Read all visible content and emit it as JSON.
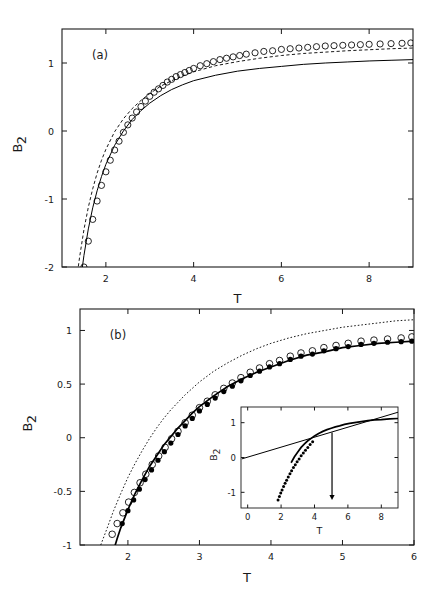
{
  "figure": {
    "background": "#ffffff",
    "foreground": "#000000",
    "width": 436,
    "height": 614
  },
  "chart_data": [
    {
      "id": "panel-a",
      "type": "line",
      "title": "",
      "panel_label": "(a)",
      "xlabel": "T",
      "ylabel": "B2",
      "ylabel_display": "B",
      "ylabel_sub": "2",
      "xlim": [
        1.0,
        9.0
      ],
      "ylim": [
        -2.0,
        1.5
      ],
      "xticks": [
        2,
        4,
        6,
        8
      ],
      "xticklabels": [
        "2",
        "4",
        "6",
        "8"
      ],
      "yticks": [
        1,
        0,
        -1,
        -2
      ],
      "yticklabels": [
        "1",
        "0",
        "-1",
        "-2"
      ],
      "grid": false,
      "legend": "none",
      "plot_box_px": {
        "x": 62,
        "y": 29,
        "w": 351,
        "h": 238
      },
      "series": [
        {
          "name": "solid-curve",
          "style": "solid",
          "x": [
            1.4,
            1.45,
            1.5,
            1.6,
            1.7,
            1.8,
            1.9,
            2.0,
            2.2,
            2.4,
            2.6,
            2.8,
            3.0,
            3.25,
            3.5,
            3.75,
            4.0,
            4.5,
            5.0,
            5.5,
            6.0,
            6.5,
            7.0,
            7.5,
            8.0,
            8.5,
            9.0
          ],
          "y": [
            -2.35,
            -2.07,
            -1.83,
            -1.44,
            -1.13,
            -0.88,
            -0.67,
            -0.49,
            -0.21,
            0.0,
            0.17,
            0.3,
            0.41,
            0.52,
            0.61,
            0.68,
            0.74,
            0.82,
            0.88,
            0.92,
            0.95,
            0.98,
            1.0,
            1.015,
            1.03,
            1.04,
            1.05
          ]
        },
        {
          "name": "dashed-curve",
          "style": "dashed",
          "x": [
            1.3,
            1.35,
            1.4,
            1.5,
            1.6,
            1.7,
            1.8,
            1.9,
            2.0,
            2.2,
            2.4,
            2.6,
            2.8,
            3.0,
            3.25,
            3.5,
            3.75,
            4.0,
            4.5,
            5.0,
            5.5,
            6.0,
            6.5,
            7.0,
            7.5,
            8.0,
            8.5,
            9.0
          ],
          "y": [
            -2.4,
            -2.1,
            -1.86,
            -1.45,
            -1.12,
            -0.85,
            -0.62,
            -0.43,
            -0.27,
            -0.01,
            0.18,
            0.33,
            0.45,
            0.55,
            0.66,
            0.74,
            0.81,
            0.87,
            0.96,
            1.02,
            1.07,
            1.11,
            1.14,
            1.16,
            1.18,
            1.195,
            1.21,
            1.22
          ]
        },
        {
          "name": "open-circle-markers",
          "style": "open-circles",
          "marker_radius_px": 3.1,
          "x": [
            1.5,
            1.6,
            1.7,
            1.8,
            1.9,
            2.0,
            2.1,
            2.2,
            2.3,
            2.4,
            2.5,
            2.6,
            2.7,
            2.8,
            2.9,
            3.0,
            3.1,
            3.2,
            3.3,
            3.4,
            3.5,
            3.6,
            3.7,
            3.8,
            3.9,
            4.0,
            4.15,
            4.3,
            4.45,
            4.6,
            4.75,
            4.9,
            5.05,
            5.2,
            5.4,
            5.6,
            5.8,
            6.0,
            6.2,
            6.4,
            6.6,
            6.8,
            7.0,
            7.2,
            7.4,
            7.6,
            7.8,
            8.0,
            8.25,
            8.5,
            8.75,
            8.95
          ],
          "y": [
            -2.0,
            -1.62,
            -1.3,
            -1.03,
            -0.8,
            -0.6,
            -0.43,
            -0.28,
            -0.15,
            -0.02,
            0.09,
            0.19,
            0.28,
            0.36,
            0.44,
            0.51,
            0.57,
            0.62,
            0.67,
            0.72,
            0.76,
            0.8,
            0.83,
            0.86,
            0.89,
            0.92,
            0.96,
            0.99,
            1.02,
            1.05,
            1.07,
            1.09,
            1.11,
            1.13,
            1.15,
            1.17,
            1.18,
            1.2,
            1.21,
            1.22,
            1.23,
            1.24,
            1.25,
            1.255,
            1.26,
            1.265,
            1.27,
            1.275,
            1.28,
            1.285,
            1.29,
            1.295
          ]
        }
      ]
    },
    {
      "id": "panel-b",
      "type": "line",
      "title": "",
      "panel_label": "(b)",
      "xlabel": "T",
      "ylabel": "B2",
      "ylabel_display": "B",
      "ylabel_sub": "2",
      "xlim": [
        1.33,
        6.0
      ],
      "ylim": [
        -1.0,
        1.2
      ],
      "xticks": [
        2,
        3,
        4,
        5,
        6
      ],
      "xticklabels": [
        "2",
        "3",
        "4",
        "5",
        "6"
      ],
      "yticks": [
        1,
        0.5,
        0,
        -0.5,
        -1
      ],
      "yticklabels": [
        "1",
        "0.5",
        "0",
        "-0.5",
        "-1"
      ],
      "grid": false,
      "legend": "none",
      "plot_box_px": {
        "x": 80,
        "y": 309,
        "w": 334,
        "h": 236
      },
      "series": [
        {
          "name": "dotted-upper-curve",
          "style": "dotted",
          "x": [
            1.62,
            1.7,
            1.8,
            1.9,
            2.0,
            2.1,
            2.2,
            2.3,
            2.4,
            2.5,
            2.6,
            2.7,
            2.8,
            2.9,
            3.0,
            3.2,
            3.4,
            3.6,
            3.8,
            4.0,
            4.25,
            4.5,
            4.75,
            5.0,
            5.25,
            5.5,
            5.75,
            6.0
          ],
          "y": [
            -1.0,
            -0.86,
            -0.68,
            -0.52,
            -0.37,
            -0.24,
            -0.12,
            -0.01,
            0.09,
            0.18,
            0.26,
            0.33,
            0.4,
            0.46,
            0.52,
            0.62,
            0.7,
            0.77,
            0.83,
            0.88,
            0.93,
            0.97,
            1.0,
            1.03,
            1.05,
            1.07,
            1.09,
            1.1
          ]
        },
        {
          "name": "solid-thick-lower-curve",
          "style": "solid-thick",
          "x": [
            1.8,
            1.85,
            1.9,
            2.0,
            2.1,
            2.2,
            2.3,
            2.4,
            2.5,
            2.6,
            2.7,
            2.8,
            2.9,
            3.0,
            3.2,
            3.4,
            3.6,
            3.8,
            4.0,
            4.25,
            4.5,
            4.75,
            5.0,
            5.25,
            5.5,
            5.75,
            6.0
          ],
          "y": [
            -1.05,
            -0.94,
            -0.84,
            -0.67,
            -0.52,
            -0.39,
            -0.27,
            -0.17,
            -0.07,
            0.01,
            0.09,
            0.16,
            0.23,
            0.29,
            0.39,
            0.48,
            0.55,
            0.61,
            0.66,
            0.72,
            0.77,
            0.8,
            0.84,
            0.86,
            0.88,
            0.89,
            0.9
          ]
        },
        {
          "name": "open-circle-markers",
          "style": "open-circles",
          "marker_radius_px": 3.3,
          "x": [
            1.78,
            1.85,
            1.93,
            2.01,
            2.09,
            2.17,
            2.25,
            2.34,
            2.43,
            2.52,
            2.61,
            2.7,
            2.8,
            2.9,
            3.0,
            3.11,
            3.22,
            3.34,
            3.46,
            3.58,
            3.71,
            3.84,
            3.98,
            4.12,
            4.27,
            4.42,
            4.58,
            4.74,
            4.91,
            5.08,
            5.26,
            5.44,
            5.63,
            5.82,
            5.97
          ],
          "y": [
            -0.9,
            -0.8,
            -0.7,
            -0.6,
            -0.51,
            -0.42,
            -0.34,
            -0.25,
            -0.17,
            -0.09,
            -0.01,
            0.06,
            0.14,
            0.21,
            0.28,
            0.34,
            0.4,
            0.46,
            0.51,
            0.56,
            0.61,
            0.65,
            0.69,
            0.72,
            0.76,
            0.79,
            0.81,
            0.84,
            0.86,
            0.88,
            0.9,
            0.91,
            0.92,
            0.93,
            0.94
          ]
        },
        {
          "name": "filled-circle-markers",
          "style": "filled-circles",
          "marker_radius_px": 2.6,
          "x": [
            1.92,
            2.0,
            2.08,
            2.16,
            2.24,
            2.33,
            2.42,
            2.51,
            2.6,
            2.7,
            2.8,
            2.9,
            3.0,
            3.11,
            3.22,
            3.34,
            3.46,
            3.58,
            3.71,
            3.84,
            3.98,
            4.12,
            4.27,
            4.42,
            4.58,
            4.74,
            4.91,
            5.08,
            5.26,
            5.44,
            5.63,
            5.82,
            5.97
          ],
          "y": [
            -0.8,
            -0.68,
            -0.58,
            -0.48,
            -0.39,
            -0.3,
            -0.21,
            -0.13,
            -0.05,
            0.03,
            0.11,
            0.18,
            0.25,
            0.31,
            0.37,
            0.43,
            0.48,
            0.53,
            0.58,
            0.62,
            0.66,
            0.69,
            0.73,
            0.76,
            0.78,
            0.81,
            0.83,
            0.85,
            0.87,
            0.88,
            0.89,
            0.895,
            0.9
          ]
        }
      ],
      "inset": {
        "id": "panel-b-inset",
        "type": "line",
        "xlabel": "T",
        "ylabel": "B2",
        "ylabel_display": "B",
        "ylabel_sub": "2",
        "xlim": [
          -0.4,
          9.0
        ],
        "ylim": [
          -1.45,
          1.45
        ],
        "xticks": [
          0,
          2,
          4,
          6,
          8
        ],
        "xticklabels": [
          "0",
          "2",
          "4",
          "6",
          "8"
        ],
        "yticks": [
          1,
          0,
          -1
        ],
        "yticklabels": [
          "1",
          "0",
          "-1"
        ],
        "grid": false,
        "plot_box_px": {
          "x": 241,
          "y": 407,
          "w": 157,
          "h": 101
        },
        "arrow": {
          "x": 5.05,
          "y_top": 0.72,
          "y_bottom": -1.22,
          "label": ""
        },
        "series": [
          {
            "name": "tangent-straight-line",
            "style": "solid",
            "x": [
              -0.35,
              9.0
            ],
            "y": [
              -0.04,
              1.3
            ]
          },
          {
            "name": "thick-solid-curve",
            "style": "solid-thick",
            "x": [
              2.6,
              2.8,
              3.0,
              3.2,
              3.4,
              3.6,
              3.8,
              4.0,
              4.25,
              4.5,
              4.75,
              5.0,
              5.25,
              5.5,
              5.8,
              6.1,
              6.4,
              6.8,
              7.2,
              7.6,
              8.0,
              8.5,
              9.0
            ],
            "y": [
              -0.15,
              0.02,
              0.16,
              0.29,
              0.39,
              0.48,
              0.55,
              0.62,
              0.69,
              0.75,
              0.8,
              0.84,
              0.88,
              0.91,
              0.95,
              0.98,
              1.0,
              1.03,
              1.06,
              1.08,
              1.09,
              1.11,
              1.12
            ]
          },
          {
            "name": "dotted-marker-curve",
            "style": "dotted-markers",
            "marker_radius_px": 1.5,
            "x": [
              1.82,
              1.9,
              1.98,
              2.06,
              2.15,
              2.24,
              2.33,
              2.43,
              2.53,
              2.63,
              2.74,
              2.85,
              2.96,
              3.08,
              3.2,
              3.33,
              3.46,
              3.6,
              3.74,
              3.89
            ],
            "y": [
              -1.22,
              -1.12,
              -1.02,
              -0.93,
              -0.83,
              -0.74,
              -0.65,
              -0.56,
              -0.47,
              -0.38,
              -0.29,
              -0.21,
              -0.12,
              -0.04,
              0.05,
              0.13,
              0.21,
              0.29,
              0.37,
              0.45
            ]
          }
        ]
      }
    }
  ]
}
